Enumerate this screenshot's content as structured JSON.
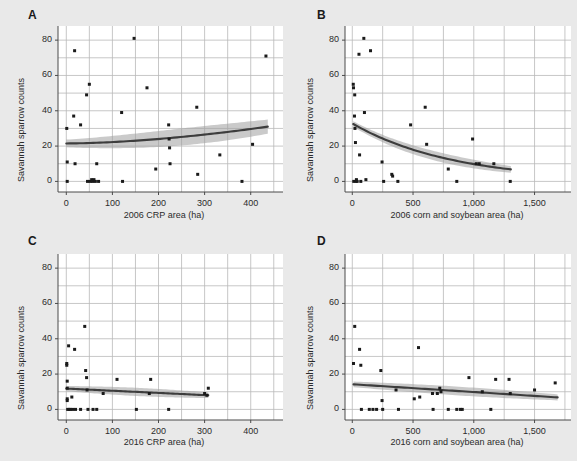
{
  "figure": {
    "background_color": "#e9e9e9",
    "panel_background_color": "#ffffff",
    "grid_color": "#b9b9b9",
    "point_color": "#1a1a1a",
    "line_color": "#3d3d3d",
    "band_color": "#9e9e9e",
    "axis_color": "#4a4a4a"
  },
  "panels": {
    "a": {
      "letter": "A"
    },
    "b": {
      "letter": "B"
    },
    "c": {
      "letter": "C"
    },
    "d": {
      "letter": "D"
    }
  },
  "chart_data": [
    {
      "panel": "A",
      "type": "scatter",
      "title": "",
      "xlabel": "2006 CRP area (ha)",
      "ylabel": "Savannah sparrow counts",
      "xlim": [
        -18,
        470
      ],
      "ylim": [
        -6,
        88
      ],
      "xticks": [
        0,
        100,
        200,
        300,
        400
      ],
      "xticklabels": [
        "0",
        "100",
        "200",
        "300",
        "400"
      ],
      "yticks": [
        0,
        20,
        40,
        60,
        80
      ],
      "yticklabels": [
        "0",
        "20",
        "40",
        "60",
        "80"
      ],
      "grid": true,
      "grid_x": [
        0,
        50,
        100,
        150,
        200,
        250,
        300,
        350,
        400,
        450
      ],
      "grid_y": [
        0,
        10,
        20,
        30,
        40,
        50,
        60,
        70,
        80
      ],
      "legend": "none",
      "points": [
        [
          1,
          30
        ],
        [
          2,
          11
        ],
        [
          2,
          0
        ],
        [
          16,
          37
        ],
        [
          18,
          74
        ],
        [
          19,
          10
        ],
        [
          31,
          32
        ],
        [
          44,
          49
        ],
        [
          46,
          0
        ],
        [
          50,
          55
        ],
        [
          52,
          0
        ],
        [
          55,
          1
        ],
        [
          57,
          0
        ],
        [
          60,
          1
        ],
        [
          63,
          0
        ],
        [
          66,
          10
        ],
        [
          70,
          0
        ],
        [
          120,
          39
        ],
        [
          122,
          0
        ],
        [
          147,
          81
        ],
        [
          175,
          53
        ],
        [
          194,
          7
        ],
        [
          222,
          32
        ],
        [
          223,
          24
        ],
        [
          224,
          19
        ],
        [
          225,
          10
        ],
        [
          283,
          42
        ],
        [
          285,
          4
        ],
        [
          333,
          15
        ],
        [
          381,
          0
        ],
        [
          404,
          21
        ],
        [
          433,
          71
        ]
      ],
      "fit": {
        "type": "increasing-curve",
        "x_start": 0,
        "x_end": 437,
        "y_start": 21.5,
        "y_end": 31.0,
        "band_halfwidth_start": 2.2,
        "band_halfwidth_end": 4.0
      }
    },
    {
      "panel": "B",
      "type": "scatter",
      "title": "",
      "xlabel": "2006 corn and soybean area (ha)",
      "ylabel": "Savannah sparrow counts",
      "xlim": [
        -60,
        1800
      ],
      "ylim": [
        -6,
        88
      ],
      "xticks": [
        0,
        500,
        1000,
        1500
      ],
      "xticklabels": [
        "0",
        "500",
        "1,000",
        "1,500"
      ],
      "yticks": [
        0,
        20,
        40,
        60,
        80
      ],
      "yticklabels": [
        "0",
        "20",
        "40",
        "60",
        "80"
      ],
      "grid": true,
      "grid_x": [
        0,
        250,
        500,
        750,
        1000,
        1250,
        1500,
        1750
      ],
      "grid_y": [
        0,
        10,
        20,
        30,
        40,
        50,
        60,
        70,
        80
      ],
      "legend": "none",
      "points": [
        [
          8,
          55
        ],
        [
          10,
          53
        ],
        [
          12,
          0
        ],
        [
          18,
          37
        ],
        [
          20,
          49
        ],
        [
          22,
          30
        ],
        [
          26,
          22
        ],
        [
          30,
          0
        ],
        [
          34,
          1
        ],
        [
          40,
          0
        ],
        [
          55,
          72
        ],
        [
          60,
          15
        ],
        [
          70,
          0
        ],
        [
          95,
          81
        ],
        [
          100,
          39
        ],
        [
          112,
          1
        ],
        [
          150,
          74
        ],
        [
          245,
          11
        ],
        [
          258,
          0
        ],
        [
          325,
          4
        ],
        [
          332,
          3
        ],
        [
          375,
          0
        ],
        [
          480,
          32
        ],
        [
          600,
          42
        ],
        [
          612,
          21
        ],
        [
          790,
          7
        ],
        [
          860,
          0
        ],
        [
          990,
          24
        ],
        [
          1020,
          10
        ],
        [
          1045,
          10
        ],
        [
          1165,
          10
        ],
        [
          1300,
          0
        ]
      ],
      "fit": {
        "type": "decreasing-curve",
        "x_start": 8,
        "x_end": 1305,
        "y_start": 32.5,
        "y_end": 6.8,
        "band_halfwidth_start": 1.6,
        "band_halfwidth_end": 1.9
      }
    },
    {
      "panel": "C",
      "type": "scatter",
      "title": "",
      "xlabel": "2016 CRP area (ha)",
      "ylabel": "Savannah sparrow counts",
      "xlim": [
        -18,
        470
      ],
      "ylim": [
        -6,
        88
      ],
      "xticks": [
        0,
        100,
        200,
        300,
        400
      ],
      "xticklabels": [
        "0",
        "100",
        "200",
        "300",
        "400"
      ],
      "yticks": [
        0,
        20,
        40,
        60,
        80
      ],
      "yticklabels": [
        "0",
        "20",
        "40",
        "60",
        "80"
      ],
      "grid": true,
      "grid_x": [
        0,
        50,
        100,
        150,
        200,
        250,
        300,
        350,
        400,
        450
      ],
      "grid_y": [
        0,
        10,
        20,
        30,
        40,
        50,
        60,
        70,
        80
      ],
      "legend": "none",
      "points": [
        [
          1,
          26
        ],
        [
          1,
          25
        ],
        [
          2,
          16
        ],
        [
          2,
          12
        ],
        [
          2,
          6
        ],
        [
          2,
          5
        ],
        [
          3,
          0
        ],
        [
          5,
          36
        ],
        [
          6,
          0
        ],
        [
          9,
          0
        ],
        [
          12,
          7
        ],
        [
          14,
          0
        ],
        [
          18,
          34
        ],
        [
          20,
          0
        ],
        [
          31,
          0
        ],
        [
          40,
          47
        ],
        [
          42,
          22
        ],
        [
          44,
          18
        ],
        [
          45,
          11
        ],
        [
          47,
          0
        ],
        [
          58,
          0
        ],
        [
          66,
          0
        ],
        [
          80,
          9
        ],
        [
          110,
          17
        ],
        [
          152,
          0
        ],
        [
          180,
          9
        ],
        [
          183,
          17
        ],
        [
          222,
          0
        ],
        [
          300,
          9
        ],
        [
          305,
          8
        ],
        [
          308,
          12
        ]
      ],
      "fit": {
        "type": "linear",
        "x_start": 0,
        "x_end": 308,
        "y_start": 11.8,
        "y_end": 8.0,
        "band_halfwidth_start": 1.5,
        "band_halfwidth_end": 1.6
      }
    },
    {
      "panel": "D",
      "type": "scatter",
      "title": "",
      "xlabel": "2016 corn and soybean area (ha)",
      "ylabel": "Savannah sparrow counts",
      "xlim": [
        -60,
        1800
      ],
      "ylim": [
        -6,
        88
      ],
      "xticks": [
        0,
        500,
        1000,
        1500
      ],
      "xticklabels": [
        "0",
        "500",
        "1,000",
        "1,500"
      ],
      "yticks": [
        0,
        20,
        40,
        60,
        80
      ],
      "yticklabels": [
        "0",
        "20",
        "40",
        "60",
        "80"
      ],
      "grid": true,
      "grid_x": [
        0,
        250,
        500,
        750,
        1000,
        1250,
        1500,
        1750
      ],
      "grid_y": [
        0,
        10,
        20,
        30,
        40,
        50,
        60,
        70,
        80
      ],
      "legend": "none",
      "points": [
        [
          10,
          26
        ],
        [
          20,
          47
        ],
        [
          60,
          34
        ],
        [
          70,
          25
        ],
        [
          75,
          0
        ],
        [
          140,
          0
        ],
        [
          170,
          0
        ],
        [
          200,
          0
        ],
        [
          235,
          22
        ],
        [
          245,
          5
        ],
        [
          250,
          0
        ],
        [
          360,
          11
        ],
        [
          380,
          0
        ],
        [
          510,
          6
        ],
        [
          545,
          35
        ],
        [
          555,
          7
        ],
        [
          660,
          9
        ],
        [
          665,
          0
        ],
        [
          700,
          9
        ],
        [
          720,
          12
        ],
        [
          730,
          10
        ],
        [
          790,
          0
        ],
        [
          860,
          0
        ],
        [
          890,
          0
        ],
        [
          905,
          0
        ],
        [
          960,
          18
        ],
        [
          1070,
          10
        ],
        [
          1140,
          0
        ],
        [
          1180,
          17
        ],
        [
          1290,
          17
        ],
        [
          1300,
          9
        ],
        [
          1500,
          11
        ],
        [
          1670,
          15
        ]
      ],
      "fit": {
        "type": "linear",
        "x_start": 10,
        "x_end": 1690,
        "y_start": 14.2,
        "y_end": 6.8,
        "band_halfwidth_start": 1.6,
        "band_halfwidth_end": 1.7
      }
    }
  ]
}
